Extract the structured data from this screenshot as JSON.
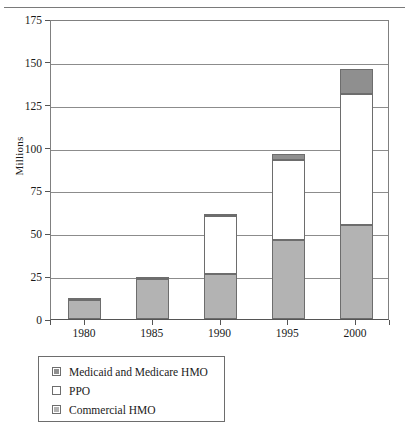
{
  "chart_data": {
    "type": "bar",
    "subtype": "stacked-bar",
    "title": "",
    "xlabel": "",
    "ylabel": "Millions",
    "ylim": [
      0,
      175
    ],
    "yticks": [
      0,
      25,
      50,
      75,
      100,
      125,
      150,
      175
    ],
    "ytick_labels": [
      "0",
      "25",
      "50",
      "75",
      "100",
      "125",
      "150",
      "175"
    ],
    "grid": true,
    "grid_axis": "y",
    "legend_position": "below-left",
    "categories": [
      "1980",
      "1985",
      "1990",
      "1995",
      "2000"
    ],
    "series": [
      {
        "name": "Commercial HMO",
        "color": "#b3b3b3",
        "values": [
          11,
          23.5,
          26.5,
          46,
          55
        ]
      },
      {
        "name": "PPO",
        "color": "#ffffff",
        "values": [
          0,
          0,
          33.5,
          47,
          76
        ]
      },
      {
        "name": "Medicaid and Medicare HMO",
        "color": "#8f8f8f",
        "values": [
          1,
          1,
          1.5,
          3,
          15
        ]
      }
    ],
    "stack_order_bottom_to_top": [
      "Commercial HMO",
      "PPO",
      "Medicaid and Medicare HMO"
    ],
    "totals": [
      12,
      24.5,
      61.5,
      96,
      146
    ]
  },
  "axis": {
    "y_title": "Millions",
    "y_tick_labels": [
      "175",
      "150",
      "125",
      "100",
      "75",
      "50",
      "25",
      "0"
    ],
    "x_tick_labels": [
      "1980",
      "1985",
      "1990",
      "1995",
      "2000"
    ]
  },
  "legend": {
    "items": [
      {
        "label": "Medicaid and Medicare HMO",
        "swatch": "filled-gray-dark"
      },
      {
        "label": "PPO",
        "swatch": "empty-white"
      },
      {
        "label": "Commercial HMO",
        "swatch": "filled-gray-light"
      }
    ]
  },
  "colors": {
    "commercial_hmo": "#b3b3b3",
    "ppo": "#ffffff",
    "medicaid_medicare_hmo": "#8f8f8f",
    "outline": "#6d6d6d",
    "gridline": "#8c8c8c",
    "axis": "#555555",
    "rule": "#7a7a7a"
  }
}
